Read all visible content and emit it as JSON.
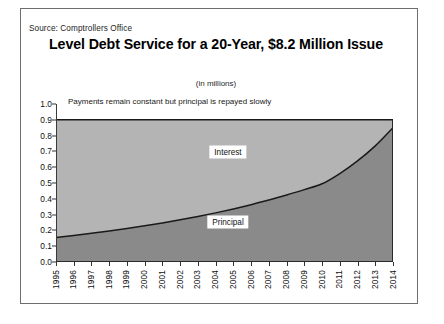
{
  "source": "Source: Comptrollers Office",
  "title": "Level Debt Service for a 20-Year, $8.2 Million Issue",
  "subtitle": "(in millions)",
  "annotation": "Payments remain constant but principal is repayed slowly",
  "colors": {
    "interest_fill": "#b4b4b4",
    "principal_fill": "#8a8a8a",
    "line": "#1a1a1a",
    "frame": "#6e6e6e"
  },
  "chart_data": {
    "type": "area",
    "title": "Level Debt Service for a 20-Year, $8.2 Million Issue",
    "subtitle": "(in millions)",
    "annotation": "Payments remain constant but principal is repayed slowly",
    "xlabel": "",
    "ylabel": "",
    "ylim": [
      0.0,
      1.0
    ],
    "ytick_labels": [
      "1.0",
      "0.9",
      "0.8",
      "0.7",
      "0.6",
      "0.5",
      "0.4",
      "0.3",
      "0.2",
      "0.1",
      "0.0"
    ],
    "ytick_values": [
      1.0,
      0.9,
      0.8,
      0.7,
      0.6,
      0.5,
      0.4,
      0.3,
      0.2,
      0.1,
      0.0
    ],
    "grid": false,
    "legend": "inline-area-labels",
    "stacked": true,
    "total_payment": 0.9,
    "categories": [
      "1995",
      "1996",
      "1997",
      "1998",
      "1999",
      "2000",
      "2001",
      "2002",
      "2003",
      "2004",
      "2005",
      "2006",
      "2007",
      "2008",
      "2009",
      "2010",
      "2011",
      "2012",
      "2013",
      "2014"
    ],
    "series": [
      {
        "name": "Principal",
        "values": [
          0.155,
          0.168,
          0.182,
          0.196,
          0.212,
          0.229,
          0.247,
          0.267,
          0.288,
          0.311,
          0.336,
          0.363,
          0.392,
          0.424,
          0.458,
          0.495,
          0.56,
          0.64,
          0.735,
          0.85
        ]
      },
      {
        "name": "Interest",
        "values": [
          0.745,
          0.732,
          0.718,
          0.704,
          0.688,
          0.671,
          0.653,
          0.633,
          0.612,
          0.589,
          0.564,
          0.537,
          0.508,
          0.476,
          0.442,
          0.405,
          0.34,
          0.26,
          0.165,
          0.05
        ]
      }
    ]
  }
}
